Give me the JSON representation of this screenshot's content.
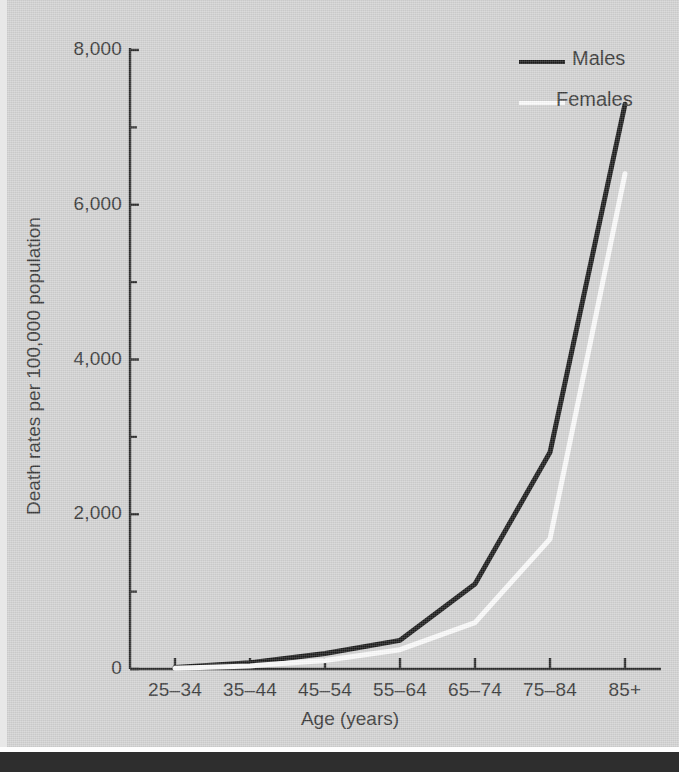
{
  "chart_data": {
    "type": "line",
    "title": "",
    "xlabel": "Age (years)",
    "ylabel": "Death rates per 100,000 population",
    "categories": [
      "25–34",
      "35–44",
      "45–54",
      "55–64",
      "65–74",
      "75–84",
      "85+"
    ],
    "series": [
      {
        "name": "Males",
        "color": "#1c1c1c",
        "values": [
          20,
          80,
          200,
          370,
          1100,
          2800,
          7300
        ]
      },
      {
        "name": "Females",
        "color": "#fbfbfb",
        "values": [
          10,
          40,
          110,
          250,
          600,
          1680,
          6400
        ]
      }
    ],
    "ylim": [
      0,
      8000
    ],
    "ytick_values": [
      0,
      2000,
      4000,
      6000,
      8000
    ],
    "ytick_labels": [
      "0",
      "2,000",
      "4,000",
      "6,000",
      "8,000"
    ],
    "yminor_tick_values": [
      1000,
      3000,
      5000,
      7000
    ],
    "grid": false,
    "legend_position": "top-right"
  },
  "legend": {
    "entries": [
      {
        "label": "Males",
        "swatch_color": "#1c1c1c"
      },
      {
        "label": "Females",
        "swatch_color": "#fbfbfb"
      }
    ]
  },
  "page": {
    "background_color": "#d3d3d3",
    "axis_color": "#2b2b2b",
    "text_color": "#3a3a3a"
  }
}
